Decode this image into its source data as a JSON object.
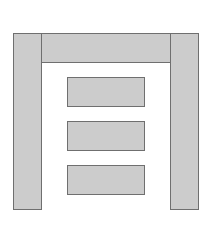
{
  "diagram": {
    "type": "block-layout",
    "fill_color": "#cccccc",
    "stroke_color": "#6f6f6f",
    "background": "#ffffff",
    "shapes": [
      {
        "id": "left-column",
        "x": 13,
        "y": 33,
        "w": 29,
        "h": 177
      },
      {
        "id": "header-bar",
        "x": 41,
        "y": 33,
        "w": 130,
        "h": 30
      },
      {
        "id": "right-column",
        "x": 170,
        "y": 33,
        "w": 29,
        "h": 177
      },
      {
        "id": "content-block-1",
        "x": 67,
        "y": 77,
        "w": 78,
        "h": 30
      },
      {
        "id": "content-block-2",
        "x": 67,
        "y": 121,
        "w": 78,
        "h": 30
      },
      {
        "id": "content-block-3",
        "x": 67,
        "y": 165,
        "w": 78,
        "h": 30
      }
    ]
  }
}
